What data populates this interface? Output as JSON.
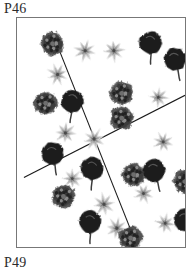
{
  "figure": {
    "top_label": "P46",
    "bottom_label": "P49",
    "colors": {
      "background": "#ffffff",
      "border": "#777777",
      "divider_line": "#1a1a1a",
      "dark_bloom": "#1c1c1c",
      "textured_bloom": "#3a3a3a",
      "light_star": "#b0b0b0"
    },
    "plot_box": {
      "x": 16,
      "y": 17,
      "width": 170,
      "height": 231
    },
    "divider_lines": [
      {
        "name": "line-nw-se",
        "x1": 35,
        "y1": 13,
        "x2": 118,
        "y2": 221
      },
      {
        "name": "line-sw-ne",
        "x1": 7,
        "y1": 161,
        "x2": 170,
        "y2": 78
      }
    ],
    "legend": [
      {
        "key": "dark_bloom",
        "label": "dark solid bloom with stem"
      },
      {
        "key": "textured_bloom",
        "label": "dark textured round bloom"
      },
      {
        "key": "light_star",
        "label": "light grey star daisy"
      }
    ],
    "markers": [
      {
        "type": "textured_bloom",
        "x": 36,
        "y": 26,
        "r": 12,
        "rot": 10
      },
      {
        "type": "light_star",
        "x": 69,
        "y": 33,
        "r": 11,
        "rot": 15
      },
      {
        "type": "light_star",
        "x": 98,
        "y": 33,
        "r": 11,
        "rot": 40
      },
      {
        "type": "dark_bloom",
        "x": 135,
        "y": 26,
        "r": 12,
        "rot": 5
      },
      {
        "type": "dark_bloom",
        "x": 160,
        "y": 43,
        "r": 12,
        "rot": -8
      },
      {
        "type": "light_star",
        "x": 41,
        "y": 57,
        "r": 11,
        "rot": 25
      },
      {
        "type": "textured_bloom",
        "x": 106,
        "y": 76,
        "r": 12,
        "rot": 20
      },
      {
        "type": "light_star",
        "x": 143,
        "y": 80,
        "r": 10,
        "rot": 50
      },
      {
        "type": "textured_bloom",
        "x": 29,
        "y": 86,
        "r": 12,
        "rot": 35
      },
      {
        "type": "dark_bloom",
        "x": 56,
        "y": 85,
        "r": 12,
        "rot": 12
      },
      {
        "type": "textured_bloom",
        "x": 106,
        "y": 101,
        "r": 12,
        "rot": 60
      },
      {
        "type": "light_star",
        "x": 49,
        "y": 116,
        "r": 11,
        "rot": 5
      },
      {
        "type": "light_star",
        "x": 78,
        "y": 122,
        "r": 11,
        "rot": 30
      },
      {
        "type": "light_star",
        "x": 148,
        "y": 125,
        "r": 10,
        "rot": 18
      },
      {
        "type": "dark_bloom",
        "x": 36,
        "y": 138,
        "r": 12,
        "rot": -5
      },
      {
        "type": "dark_bloom",
        "x": 76,
        "y": 153,
        "r": 12,
        "rot": 8
      },
      {
        "type": "light_star",
        "x": 56,
        "y": 162,
        "r": 10,
        "rot": 45
      },
      {
        "type": "textured_bloom",
        "x": 118,
        "y": 158,
        "r": 12,
        "rot": 25
      },
      {
        "type": "dark_bloom",
        "x": 139,
        "y": 155,
        "r": 12,
        "rot": -10
      },
      {
        "type": "textured_bloom",
        "x": 170,
        "y": 165,
        "r": 12,
        "rot": 15
      },
      {
        "type": "textured_bloom",
        "x": 47,
        "y": 180,
        "r": 12,
        "rot": 50
      },
      {
        "type": "light_star",
        "x": 128,
        "y": 177,
        "r": 10,
        "rot": 22
      },
      {
        "type": "light_star",
        "x": 88,
        "y": 188,
        "r": 11,
        "rot": 35
      },
      {
        "type": "dark_bloom",
        "x": 74,
        "y": 207,
        "r": 12,
        "rot": 6
      },
      {
        "type": "light_star",
        "x": 101,
        "y": 212,
        "r": 11,
        "rot": 10
      },
      {
        "type": "light_star",
        "x": 150,
        "y": 207,
        "r": 10,
        "rot": 55
      },
      {
        "type": "dark_bloom",
        "x": 170,
        "y": 205,
        "r": 12,
        "rot": -6
      },
      {
        "type": "textured_bloom",
        "x": 115,
        "y": 222,
        "r": 12,
        "rot": 30
      }
    ]
  }
}
